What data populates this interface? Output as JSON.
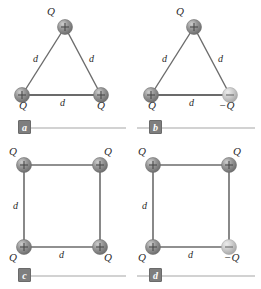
{
  "figure": {
    "type": "physics-charge-configuration-diagram",
    "background_color": "#ffffff",
    "line_color": "#6b6b6b",
    "text_color": "#2b2b2b",
    "positive_charge_color": "#8d8d8d",
    "negative_charge_color": "#c2c2c2",
    "badge_color": "#7e7e7e",
    "rule_color": "#d2d2d2"
  },
  "panels": [
    {
      "id": "a",
      "badge_label": "a",
      "shape": "equilateral-triangle",
      "charges": [
        {
          "position": "apex",
          "sign": "+",
          "label": "Q",
          "polarity": "positive"
        },
        {
          "position": "bottom-left",
          "sign": "+",
          "label": "Q",
          "polarity": "positive"
        },
        {
          "position": "bottom-right",
          "sign": "+",
          "label": "Q",
          "polarity": "positive"
        }
      ],
      "side_labels": [
        {
          "side": "left",
          "label": "d"
        },
        {
          "side": "right",
          "label": "d"
        },
        {
          "side": "bottom",
          "label": "d"
        }
      ]
    },
    {
      "id": "b",
      "badge_label": "b",
      "shape": "equilateral-triangle",
      "charges": [
        {
          "position": "apex",
          "sign": "+",
          "label": "Q",
          "polarity": "positive"
        },
        {
          "position": "bottom-left",
          "sign": "+",
          "label": "Q",
          "polarity": "positive"
        },
        {
          "position": "bottom-right",
          "sign": "−",
          "label": "−Q",
          "polarity": "negative"
        }
      ],
      "side_labels": [
        {
          "side": "left",
          "label": "d"
        },
        {
          "side": "right",
          "label": "d"
        },
        {
          "side": "bottom",
          "label": "d"
        }
      ]
    },
    {
      "id": "c",
      "badge_label": "c",
      "shape": "square",
      "charges": [
        {
          "position": "top-left",
          "sign": "+",
          "label": "Q",
          "polarity": "positive"
        },
        {
          "position": "top-right",
          "sign": "+",
          "label": "Q",
          "polarity": "positive"
        },
        {
          "position": "bottom-left",
          "sign": "+",
          "label": "Q",
          "polarity": "positive"
        },
        {
          "position": "bottom-right",
          "sign": "+",
          "label": "Q",
          "polarity": "positive"
        }
      ],
      "side_labels": [
        {
          "side": "left",
          "label": "d"
        },
        {
          "side": "bottom",
          "label": "d"
        }
      ]
    },
    {
      "id": "d",
      "badge_label": "d",
      "shape": "square",
      "charges": [
        {
          "position": "top-left",
          "sign": "+",
          "label": "Q",
          "polarity": "positive"
        },
        {
          "position": "top-right",
          "sign": "+",
          "label": "Q",
          "polarity": "positive"
        },
        {
          "position": "bottom-left",
          "sign": "+",
          "label": "Q",
          "polarity": "positive"
        },
        {
          "position": "bottom-right",
          "sign": "−",
          "label": "−Q",
          "polarity": "negative"
        }
      ],
      "side_labels": [
        {
          "side": "left",
          "label": "d"
        },
        {
          "side": "bottom",
          "label": "d"
        }
      ]
    }
  ]
}
